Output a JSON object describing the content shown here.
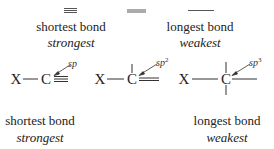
{
  "colors": {
    "ink": "#222222",
    "bond": "#555555",
    "background": "#ffffff"
  },
  "top_row": {
    "bonds": [
      {
        "type": "triple",
        "order": 3
      },
      {
        "type": "double",
        "order": 2
      },
      {
        "type": "single",
        "order": 1
      }
    ],
    "left_caption": {
      "line1": "shortest bond",
      "line2": "strongest"
    },
    "right_caption": {
      "line1": "longest bond",
      "line2": "weakest"
    }
  },
  "structures": [
    {
      "substituent": "X",
      "carbon": "C",
      "hybridization": "sp",
      "hybridization_superscript": "",
      "bond_type": "triple"
    },
    {
      "substituent": "X",
      "carbon": "C",
      "hybridization": "sp",
      "hybridization_superscript": "2",
      "bond_type": "double"
    },
    {
      "substituent": "X",
      "carbon": "C",
      "hybridization": "sp",
      "hybridization_superscript": "3",
      "bond_type": "single"
    }
  ],
  "bottom_row": {
    "left_caption": {
      "line1": "shortest bond",
      "line2": "strongest"
    },
    "right_caption": {
      "line1": "longest bond",
      "line2": "weakest"
    }
  }
}
